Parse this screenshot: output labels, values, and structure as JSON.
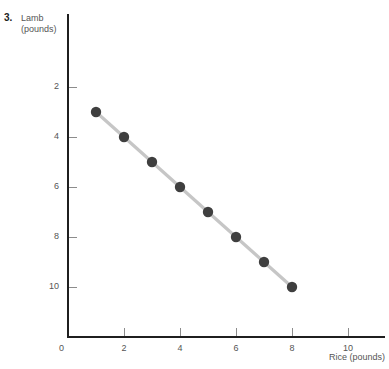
{
  "problem": {
    "number": "3."
  },
  "axes": {
    "y_title_line1": "Lamb",
    "y_title_line2": "(pounds)",
    "x_title": "Rice (pounds)",
    "origin_label": "0",
    "y_ticks": [
      "10",
      "8",
      "6",
      "4",
      "2"
    ],
    "x_ticks": [
      "2",
      "4",
      "6",
      "8",
      "10"
    ]
  },
  "style": {
    "marker_color": "#3f3f3f",
    "line_color": "#c6c6c6",
    "axis_color": "#1f1f1f",
    "tick_color": "#8c8c8c",
    "label_color": "#555555",
    "background": "#ffffff"
  },
  "chart_data": {
    "type": "line",
    "title": "",
    "xlabel": "Rice (pounds)",
    "ylabel": "Lamb (pounds)",
    "xlim": [
      0,
      11.5
    ],
    "ylim": [
      0,
      11.2
    ],
    "grid": false,
    "legend": "none",
    "x_ticks": [
      0,
      2,
      4,
      6,
      8,
      10
    ],
    "y_ticks": [
      2,
      4,
      6,
      8,
      10
    ],
    "markers": "circle",
    "series": [
      {
        "name": "Production possibilities",
        "x": [
          1,
          2,
          3,
          4,
          5,
          6,
          7,
          8
        ],
        "values": [
          9,
          8,
          7,
          6,
          5,
          4,
          3,
          2
        ]
      }
    ]
  }
}
